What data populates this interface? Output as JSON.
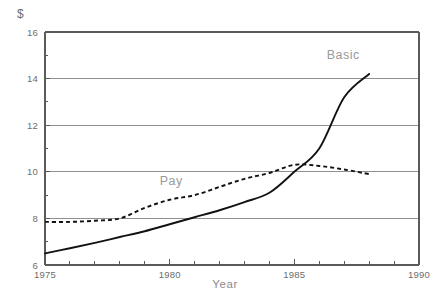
{
  "chart_data": {
    "type": "line",
    "title": "",
    "unit_label": "$",
    "xlabel": "Year",
    "ylabel": "",
    "xlim": [
      1975,
      1990
    ],
    "ylim": [
      6,
      16
    ],
    "grid": true,
    "grid_axis": "y",
    "legend": "inline-annotations",
    "x_ticks_major": [
      1975,
      1980,
      1985,
      1990
    ],
    "x_ticks_minor": [
      1976,
      1977,
      1978,
      1979,
      1981,
      1982,
      1983,
      1984,
      1986,
      1987,
      1988,
      1989
    ],
    "y_ticks_major": [
      6,
      8,
      10,
      12,
      14,
      16
    ],
    "y_ticks_minor": [
      7,
      9,
      11,
      13,
      15
    ],
    "x_tick_labels": [
      "1975",
      "1980",
      "1985",
      "1990"
    ],
    "y_tick_labels": [
      "6",
      "8",
      "10",
      "12",
      "14",
      "16"
    ],
    "series": [
      {
        "name": "Basic",
        "style": "solid",
        "color": "#121212",
        "label_position": {
          "x": 1986.3,
          "y": 14.85
        },
        "x": [
          1975,
          1976,
          1977,
          1978,
          1979,
          1980,
          1981,
          1982,
          1983,
          1984,
          1985,
          1986,
          1987,
          1988
        ],
        "values": [
          6.5,
          6.72,
          6.95,
          7.2,
          7.45,
          7.75,
          8.05,
          8.35,
          8.7,
          9.1,
          10.0,
          11.0,
          13.2,
          14.2
        ]
      },
      {
        "name": "Pay",
        "style": "dashed",
        "color": "#121212",
        "label_position": {
          "x": 1979.6,
          "y": 9.45
        },
        "x": [
          1975,
          1976,
          1977,
          1978,
          1979,
          1980,
          1981,
          1982,
          1983,
          1984,
          1985,
          1986,
          1987,
          1988
        ],
        "values": [
          7.85,
          7.85,
          7.9,
          8.0,
          8.45,
          8.8,
          9.0,
          9.35,
          9.7,
          9.95,
          10.3,
          10.25,
          10.1,
          9.9
        ]
      }
    ],
    "annotations": [
      {
        "text": "Basic",
        "series": "Basic"
      },
      {
        "text": "Pay",
        "series": "Pay"
      }
    ]
  }
}
